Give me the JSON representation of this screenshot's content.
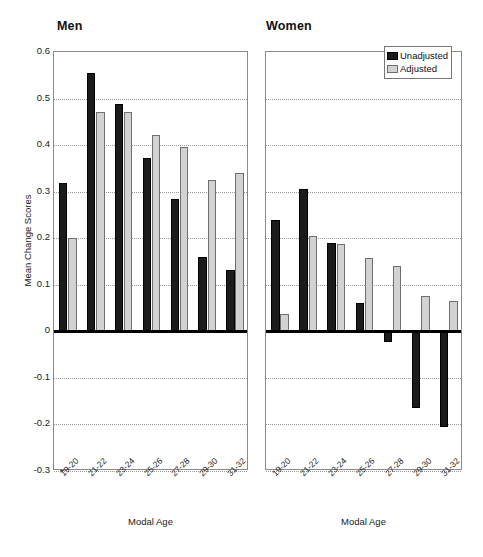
{
  "figure": {
    "yaxis_title": "Mean Change Scores",
    "xaxis_title_men": "Modal Age",
    "xaxis_title_women": "Modal Age"
  },
  "legend": {
    "position": "top-right",
    "items": [
      {
        "label": "Unadjusted",
        "color": "#1b1b1b"
      },
      {
        "label": "Adjusted",
        "color": "#d2d2d2"
      }
    ]
  },
  "chart_data": [
    {
      "type": "bar",
      "title": "Men",
      "xlabel": "Modal Age",
      "ylabel": "Mean Change Scores",
      "ylim": [
        -0.3,
        0.6
      ],
      "yticks": [
        0.6,
        0.5,
        0.4,
        0.3,
        0.2,
        0.1,
        0,
        -0.1,
        -0.2,
        -0.3
      ],
      "ytick_labels": [
        "0.6",
        "0.5",
        "0.4",
        "0.3",
        "0.2",
        "0.1",
        "0",
        "-0.1",
        "-0.2",
        "-0.3"
      ],
      "grid": true,
      "legend_position": "top-right",
      "categories": [
        "19-20",
        "21-22",
        "23-24",
        "25-26",
        "27-28",
        "29-30",
        "31-32"
      ],
      "series": [
        {
          "name": "Unadjusted",
          "color": "#1b1b1b",
          "values": [
            0.318,
            0.555,
            0.488,
            0.372,
            0.285,
            0.16,
            0.131
          ]
        },
        {
          "name": "Adjusted",
          "color": "#d2d2d2",
          "values": [
            0.201,
            0.472,
            0.471,
            0.422,
            0.395,
            0.325,
            0.341
          ]
        }
      ]
    },
    {
      "type": "bar",
      "title": "Women",
      "xlabel": "Modal Age",
      "ylabel": "Mean Change Scores",
      "ylim": [
        -0.3,
        0.6
      ],
      "yticks": [
        0.6,
        0.5,
        0.4,
        0.3,
        0.2,
        0.1,
        0,
        -0.1,
        -0.2,
        -0.3
      ],
      "ytick_labels": [
        "0.6",
        "0.5",
        "0.4",
        "0.3",
        "0.2",
        "0.1",
        "0",
        "-0.1",
        "-0.2",
        "-0.3"
      ],
      "grid": true,
      "legend_position": "top-right",
      "categories": [
        "19-20",
        "21-22",
        "23-24",
        "25-26",
        "27-28",
        "29-30",
        "31-32"
      ],
      "series": [
        {
          "name": "Unadjusted",
          "color": "#1b1b1b",
          "values": [
            0.24,
            0.305,
            0.19,
            0.06,
            -0.022,
            -0.165,
            -0.205
          ]
        },
        {
          "name": "Adjusted",
          "color": "#d2d2d2",
          "values": [
            0.038,
            0.205,
            0.188,
            0.158,
            0.14,
            0.075,
            0.065
          ]
        }
      ]
    }
  ]
}
